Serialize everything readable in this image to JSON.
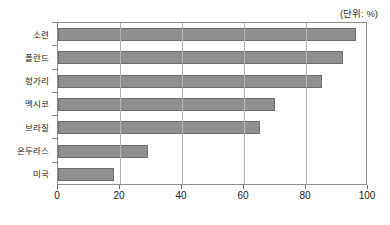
{
  "annotation": {
    "unit_note": "(단위: %)"
  },
  "chart_data": {
    "type": "bar",
    "orientation": "horizontal",
    "title": "",
    "subtitle": "",
    "xlabel": "",
    "ylabel": "",
    "unit": "%",
    "unit_note": "(단위: %)",
    "categories": [
      "소련",
      "폴란드",
      "헝가리",
      "멕시코",
      "브라질",
      "온두라스",
      "미국"
    ],
    "values": [
      96,
      92,
      85,
      70,
      65,
      29,
      18
    ],
    "xlim": [
      0,
      100
    ],
    "xticks": [
      0,
      20,
      40,
      60,
      80,
      100
    ],
    "xtick_labels": [
      "0",
      "20",
      "40",
      "60",
      "80",
      "100"
    ],
    "grid": "vertical",
    "legend": "none",
    "bar_color": "#8f8f8f",
    "bar_border_color": "#6d6d6d",
    "gridline_color": "#b4b4b4",
    "frame_color": "#8c8c8c"
  }
}
